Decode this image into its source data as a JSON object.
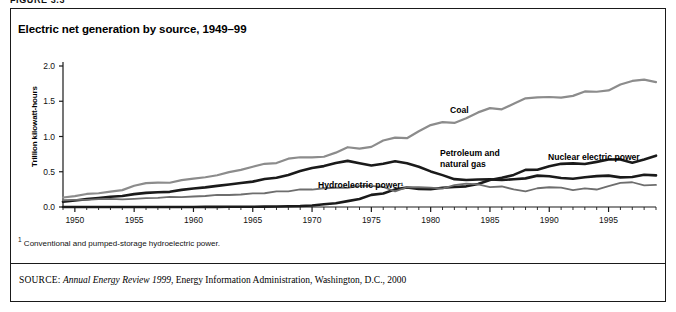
{
  "figure": {
    "number_label": "FIGURE 3.3",
    "title": "Electric net generation by source, 1949–99",
    "footnote": "Conventional and pumped-storage hydroelectric power.",
    "footnote_marker": "1",
    "source_label": "SOURCE:",
    "source_publication": "Annual Energy Review 1999",
    "source_rest": ", Energy Information Administration, Washington, D.C., 2000"
  },
  "colors": {
    "coal": "#8c8c8c",
    "petroleum_and_natural_gas": "#1a1a1a",
    "nuclear": "#1a1a1a",
    "hydroelectric": "#6e6e6e",
    "axis": "#1a1a1a",
    "border": "#1a1a1a",
    "text": "#111111"
  },
  "labels": {
    "coal": "Coal",
    "petroleum_and_natural_gas": "Petroleum and\nnatural gas",
    "nuclear": "Nuclear electric power",
    "hydroelectric": "Hydroelectric power¹"
  },
  "chart_data": {
    "type": "line",
    "title": "Electric net generation by source, 1949–99",
    "xlabel": "",
    "ylabel": "Trillion kilowatt-hours",
    "xlim": [
      1949,
      1999
    ],
    "ylim": [
      0.0,
      2.0
    ],
    "ytick_labels": [
      "0.0",
      "0.5",
      "1.0",
      "1.5",
      "2.0"
    ],
    "yticks": [
      0.0,
      0.5,
      1.0,
      1.5,
      2.0
    ],
    "xtick_labels": [
      "1950",
      "1955",
      "1960",
      "1965",
      "1970",
      "1975",
      "1980",
      "1985",
      "1990",
      "1995"
    ],
    "xticks": [
      1950,
      1955,
      1960,
      1965,
      1970,
      1975,
      1980,
      1985,
      1990,
      1995
    ],
    "minor_xtick_interval": 1,
    "grid": false,
    "legend_position": "inline-annotations",
    "x": [
      1949,
      1950,
      1951,
      1952,
      1953,
      1954,
      1955,
      1956,
      1957,
      1958,
      1959,
      1960,
      1961,
      1962,
      1963,
      1964,
      1965,
      1966,
      1967,
      1968,
      1969,
      1970,
      1971,
      1972,
      1973,
      1974,
      1975,
      1976,
      1977,
      1978,
      1979,
      1980,
      1981,
      1982,
      1983,
      1984,
      1985,
      1986,
      1987,
      1988,
      1989,
      1990,
      1991,
      1992,
      1993,
      1994,
      1995,
      1996,
      1997,
      1998,
      1999
    ],
    "series": [
      {
        "name": "Coal",
        "color": "#8c8c8c",
        "width": 2.2,
        "values": [
          0.135,
          0.155,
          0.185,
          0.195,
          0.219,
          0.239,
          0.301,
          0.339,
          0.346,
          0.344,
          0.382,
          0.403,
          0.422,
          0.45,
          0.494,
          0.526,
          0.571,
          0.613,
          0.623,
          0.685,
          0.706,
          0.704,
          0.713,
          0.771,
          0.848,
          0.828,
          0.853,
          0.944,
          0.985,
          0.976,
          1.075,
          1.162,
          1.203,
          1.192,
          1.259,
          1.342,
          1.402,
          1.386,
          1.464,
          1.541,
          1.554,
          1.56,
          1.551,
          1.576,
          1.639,
          1.635,
          1.653,
          1.737,
          1.788,
          1.807,
          1.772
        ]
      },
      {
        "name": "Petroleum and natural gas",
        "color": "#1a1a1a",
        "width": 2.6,
        "values": [
          0.075,
          0.093,
          0.112,
          0.127,
          0.145,
          0.155,
          0.183,
          0.2,
          0.21,
          0.215,
          0.243,
          0.263,
          0.278,
          0.3,
          0.32,
          0.34,
          0.36,
          0.397,
          0.415,
          0.455,
          0.51,
          0.554,
          0.58,
          0.624,
          0.654,
          0.62,
          0.589,
          0.614,
          0.65,
          0.621,
          0.572,
          0.505,
          0.452,
          0.395,
          0.383,
          0.39,
          0.392,
          0.382,
          0.393,
          0.406,
          0.445,
          0.436,
          0.411,
          0.4,
          0.422,
          0.438,
          0.445,
          0.42,
          0.426,
          0.458,
          0.449
        ]
      },
      {
        "name": "Nuclear electric power",
        "color": "#1a1a1a",
        "width": 2.6,
        "values": [
          0.0,
          0.0,
          0.0,
          0.0,
          0.0,
          0.0,
          0.0,
          0.0,
          0.001,
          0.002,
          0.002,
          0.005,
          0.017,
          0.023,
          0.03,
          0.033,
          0.038,
          0.056,
          0.075,
          0.109,
          0.139,
          0.215,
          0.38,
          0.54,
          0.83,
          1.14,
          1.72,
          1.91,
          2.5,
          2.76,
          2.55,
          2.51,
          2.72,
          2.83,
          2.93,
          3.27,
          3.83,
          4.14,
          4.55,
          5.27,
          5.29,
          5.77,
          6.12,
          6.19,
          6.1,
          6.4,
          6.73,
          6.75,
          6.29,
          6.73,
          7.28
        ]
      },
      {
        "name": "Hydroelectric power",
        "color": "#6e6e6e",
        "width": 1.8,
        "values": [
          0.096,
          0.101,
          0.101,
          0.113,
          0.114,
          0.108,
          0.116,
          0.126,
          0.13,
          0.145,
          0.14,
          0.149,
          0.156,
          0.172,
          0.17,
          0.177,
          0.194,
          0.195,
          0.222,
          0.222,
          0.25,
          0.248,
          0.266,
          0.273,
          0.272,
          0.301,
          0.3,
          0.284,
          0.221,
          0.28,
          0.28,
          0.276,
          0.261,
          0.309,
          0.332,
          0.321,
          0.281,
          0.291,
          0.25,
          0.223,
          0.266,
          0.28,
          0.276,
          0.24,
          0.265,
          0.248,
          0.296,
          0.341,
          0.351,
          0.308,
          0.313
        ]
      }
    ],
    "nuclear_scale_note": "nuclear values stored ×10"
  }
}
